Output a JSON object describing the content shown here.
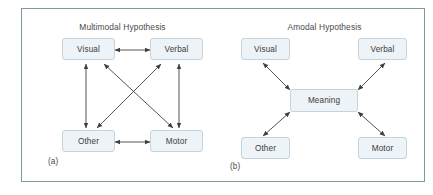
{
  "figure": {
    "frame_border_color": "#7d9aa4",
    "background_color": "#ffffff",
    "node_fill_color": "#edf3f6",
    "node_border_color": "#c3d4dc",
    "arrow_color": "#3f3f3f",
    "text_color": "#3d3d3d"
  },
  "panels": [
    {
      "id": "a",
      "title": "Multimodal Hypothesis",
      "caption": "(a)",
      "nodes": [
        {
          "id": "visual",
          "label": "Visual"
        },
        {
          "id": "verbal",
          "label": "Verbal"
        },
        {
          "id": "other",
          "label": "Other"
        },
        {
          "id": "motor",
          "label": "Motor"
        }
      ],
      "connections": [
        {
          "from": "visual",
          "to": "verbal",
          "style": "double-headed"
        },
        {
          "from": "other",
          "to": "motor",
          "style": "double-headed"
        },
        {
          "from": "visual",
          "to": "other",
          "style": "double-headed"
        },
        {
          "from": "verbal",
          "to": "motor",
          "style": "double-headed"
        },
        {
          "from": "visual",
          "to": "motor",
          "style": "double-headed"
        },
        {
          "from": "verbal",
          "to": "other",
          "style": "double-headed"
        }
      ]
    },
    {
      "id": "b",
      "title": "Amodal Hypothesis",
      "caption": "(b)",
      "nodes": [
        {
          "id": "visual",
          "label": "Visual"
        },
        {
          "id": "verbal",
          "label": "Verbal"
        },
        {
          "id": "meaning",
          "label": "Meaning"
        },
        {
          "id": "other",
          "label": "Other"
        },
        {
          "id": "motor",
          "label": "Motor"
        }
      ],
      "connections": [
        {
          "from": "meaning",
          "to": "visual",
          "style": "double-headed"
        },
        {
          "from": "meaning",
          "to": "verbal",
          "style": "double-headed"
        },
        {
          "from": "meaning",
          "to": "other",
          "style": "double-headed"
        },
        {
          "from": "meaning",
          "to": "motor",
          "style": "double-headed"
        }
      ]
    }
  ]
}
